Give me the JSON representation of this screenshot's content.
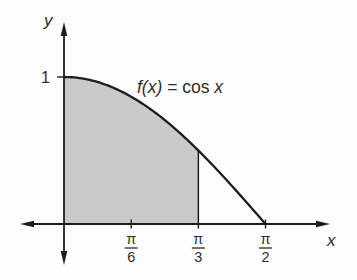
{
  "figure": {
    "curve_label": {
      "fx": "f(x)",
      "eq": " = ",
      "func": "cos",
      "var": " x"
    },
    "axis_labels": {
      "x": "x",
      "y": "y"
    }
  },
  "colors": {
    "line": "#1c1c1c",
    "shade": "#c9c9c9",
    "text": "#2e2e2e",
    "background": "#fdfdfd"
  },
  "chart_data": {
    "type": "line",
    "function": "f(x) = cos(x)",
    "x_domain_shown": [
      0,
      1.5707963
    ],
    "series": [
      {
        "name": "f(x) = cos x",
        "points": [
          {
            "x": 0.0,
            "y": 1.0
          },
          {
            "x": 0.2617994,
            "y": 0.9659
          },
          {
            "x": 0.5235988,
            "y": 0.866
          },
          {
            "x": 0.7853982,
            "y": 0.7071
          },
          {
            "x": 1.0471976,
            "y": 0.5
          },
          {
            "x": 1.3089969,
            "y": 0.2588
          },
          {
            "x": 1.5707963,
            "y": 0.0
          }
        ]
      }
    ],
    "x_ticks": [
      {
        "value": 0.5235988,
        "label": "π/6",
        "numerator": "π",
        "denominator": "6"
      },
      {
        "value": 1.0471976,
        "label": "π/3",
        "numerator": "π",
        "denominator": "3"
      },
      {
        "value": 1.5707963,
        "label": "π/2",
        "numerator": "π",
        "denominator": "2"
      }
    ],
    "y_ticks_values": [
      1
    ],
    "y_tick_labels": [
      "1"
    ],
    "shaded_region": {
      "from_x": 0,
      "to_x": 1.0471976,
      "under": "cos(x)",
      "fill": "#c9c9c9"
    },
    "grid": false,
    "legend": false
  }
}
